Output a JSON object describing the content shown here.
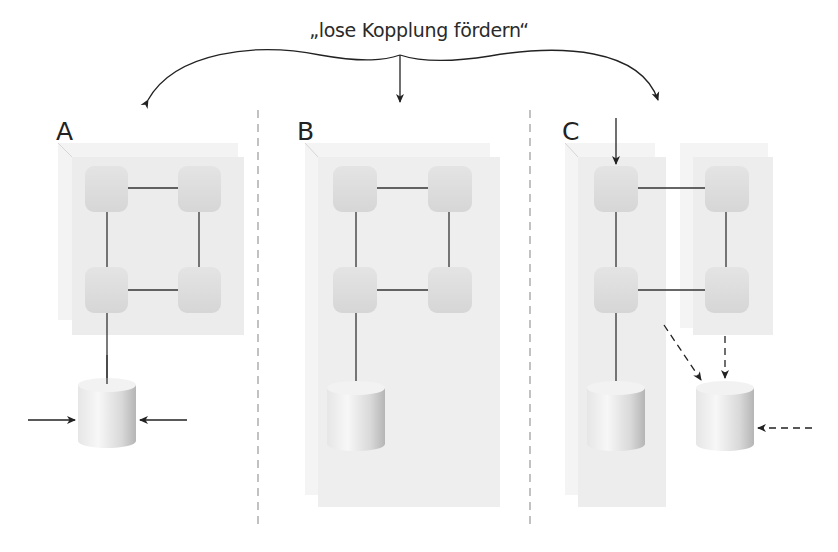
{
  "title": "„lose Kopplung fördern“",
  "panels": [
    {
      "id": "A",
      "label": "A"
    },
    {
      "id": "B",
      "label": "B"
    },
    {
      "id": "C",
      "label": "C"
    }
  ],
  "colors": {
    "box_fill": "#ececec",
    "box_back": "#f3f3f3",
    "node_fill": "#dcdcdc",
    "line": "#333333",
    "divider": "#9a9a9a",
    "cylinder_light": "#f4f4f4",
    "cylinder_dark": "#bdbdbd"
  }
}
